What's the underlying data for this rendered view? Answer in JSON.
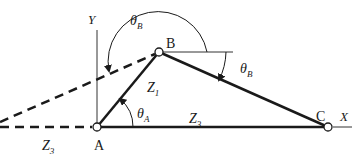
{
  "diagram": {
    "type": "four-bar linkage vector diagram",
    "points": {
      "A": "A",
      "B": "B",
      "C": "C"
    },
    "axes": {
      "x_label": "X",
      "y_label": "Y"
    },
    "links": {
      "z1": {
        "main": "Z",
        "sub": "1"
      },
      "z3_solid": {
        "main": "Z",
        "sub": "3"
      },
      "z3_dashed": {
        "main": "Z",
        "sub": "3"
      }
    },
    "angles": {
      "theta_a": {
        "main": "θ",
        "sub": "A"
      },
      "theta_b_large": {
        "main": "θ",
        "sub": "B"
      },
      "theta_b_small": {
        "main": "θ",
        "sub": "B"
      }
    },
    "colors": {
      "stroke": "#1a1a1a",
      "axis": "#333333",
      "joint_fill": "#ffffff"
    }
  }
}
